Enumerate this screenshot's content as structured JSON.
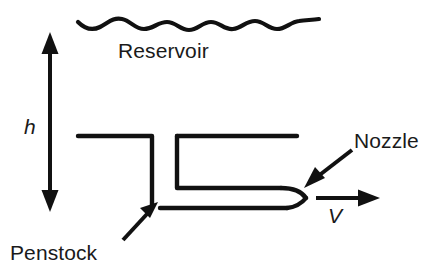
{
  "diagram": {
    "stroke_color": "#111111",
    "background_color": "#ffffff",
    "labels": {
      "reservoir": "Reservoir",
      "penstock": "Penstock",
      "nozzle": "Nozzle",
      "head_symbol": "h",
      "velocity_symbol": "V"
    },
    "elements": {
      "water_surface": "wavy-water-surface-line",
      "head_dimension": "double-headed-vertical-arrow",
      "penstock_pipe": "penstock-pipe-outline",
      "nozzle_tip": "converging-nozzle-outline",
      "jet_arrow": "jet-velocity-arrow",
      "nozzle_leader": "nozzle-callout-arrow",
      "penstock_leader": "penstock-callout-arrow"
    }
  }
}
